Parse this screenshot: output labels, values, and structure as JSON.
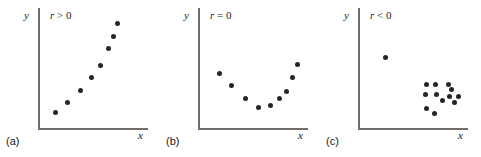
{
  "figure": {
    "background_color": "#ffffff",
    "axis_color": "#6e6e6e",
    "point_color": "#262626"
  },
  "panels": [
    {
      "caption": "(a)",
      "annotation_var": "r",
      "annotation_rel": " > 0",
      "xlabel": "x",
      "ylabel": "y"
    },
    {
      "caption": "(b)",
      "annotation_var": "r",
      "annotation_rel": " = 0",
      "xlabel": "x",
      "ylabel": "y"
    },
    {
      "caption": "(c)",
      "annotation_var": "r",
      "annotation_rel": " < 0",
      "xlabel": "x",
      "ylabel": "y"
    }
  ],
  "chart_data": [
    {
      "type": "scatter",
      "title": "r > 0",
      "xlabel": "x",
      "ylabel": "y",
      "xlim": [
        0,
        100
      ],
      "ylim": [
        0,
        100
      ],
      "grid": false,
      "legend": null,
      "annotations": [
        "r > 0"
      ],
      "series": [
        {
          "name": "positive-correlation",
          "x": [
            14,
            26,
            38,
            49,
            58,
            66,
            70,
            74
          ],
          "y": [
            14,
            22,
            33,
            44,
            55,
            70,
            80,
            92
          ]
        }
      ]
    },
    {
      "type": "scatter",
      "title": "r = 0",
      "xlabel": "x",
      "ylabel": "y",
      "xlim": [
        0,
        100
      ],
      "ylim": [
        0,
        100
      ],
      "grid": false,
      "legend": null,
      "annotations": [
        "r = 0"
      ],
      "series": [
        {
          "name": "zero-correlation-curved",
          "x": [
            18,
            30,
            43,
            56,
            67,
            76,
            83,
            89,
            94
          ],
          "y": [
            48,
            37,
            26,
            18,
            20,
            26,
            32,
            44,
            56
          ]
        }
      ]
    },
    {
      "type": "scatter",
      "title": "r < 0",
      "xlabel": "x",
      "ylabel": "y",
      "xlim": [
        0,
        100
      ],
      "ylim": [
        0,
        100
      ],
      "grid": false,
      "legend": null,
      "annotations": [
        "r < 0"
      ],
      "series": [
        {
          "name": "outlier-point",
          "x": [
            24
          ],
          "y": [
            62
          ]
        },
        {
          "name": "lower-right-cluster",
          "x": [
            64,
            72,
            85,
            63,
            73,
            86,
            95,
            79,
            64,
            71,
            91,
            88
          ],
          "y": [
            38,
            38,
            38,
            29,
            29,
            28,
            28,
            24,
            17,
            13,
            22,
            34
          ]
        }
      ]
    }
  ]
}
